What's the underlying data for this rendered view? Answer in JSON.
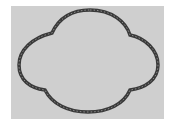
{
  "image": {
    "subject": "quatrefoil-shaped closed ring on gray background",
    "background_color": "#ffffff",
    "panel_color": "#cfcfcf",
    "ring_color": "#3a3a3a",
    "ring_inner_color": "#8a8a8a"
  }
}
